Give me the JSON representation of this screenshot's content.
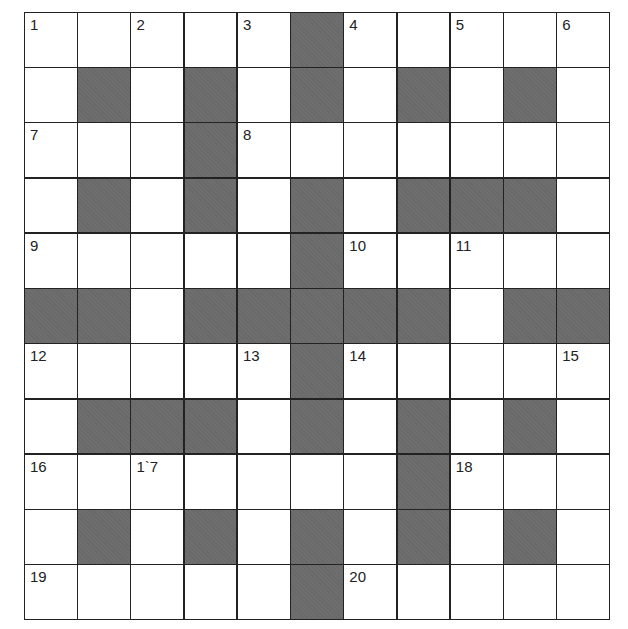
{
  "puzzle": {
    "rows": 11,
    "cols": 11,
    "block_color": "#6e6e6e",
    "layout": [
      "WWWWWBWWWWW",
      "WBWBWBWBWBW",
      "WWWBWWWWWWW",
      "WBWBWBWBBBW",
      "WWWWWBWWWWW",
      "BBWBBBBBWBB",
      "WWWWWBWWWWW",
      "WBBBWBWBWBW",
      "WWWWWWWBWWW",
      "WBWBWBWBWBW",
      "WWWWWBWWWWW"
    ],
    "numbers": [
      {
        "r": 0,
        "c": 0,
        "n": "1"
      },
      {
        "r": 0,
        "c": 2,
        "n": "2"
      },
      {
        "r": 0,
        "c": 4,
        "n": "3"
      },
      {
        "r": 0,
        "c": 6,
        "n": "4"
      },
      {
        "r": 0,
        "c": 8,
        "n": "5"
      },
      {
        "r": 0,
        "c": 10,
        "n": "6"
      },
      {
        "r": 2,
        "c": 0,
        "n": "7"
      },
      {
        "r": 2,
        "c": 4,
        "n": "8"
      },
      {
        "r": 4,
        "c": 0,
        "n": "9"
      },
      {
        "r": 4,
        "c": 6,
        "n": "10"
      },
      {
        "r": 4,
        "c": 8,
        "n": "11"
      },
      {
        "r": 6,
        "c": 0,
        "n": "12"
      },
      {
        "r": 6,
        "c": 4,
        "n": "13"
      },
      {
        "r": 6,
        "c": 6,
        "n": "14"
      },
      {
        "r": 6,
        "c": 10,
        "n": "15"
      },
      {
        "r": 8,
        "c": 0,
        "n": "16"
      },
      {
        "r": 8,
        "c": 2,
        "n": "1`7"
      },
      {
        "r": 8,
        "c": 8,
        "n": "18"
      },
      {
        "r": 10,
        "c": 0,
        "n": "19"
      },
      {
        "r": 10,
        "c": 6,
        "n": "20"
      }
    ]
  }
}
